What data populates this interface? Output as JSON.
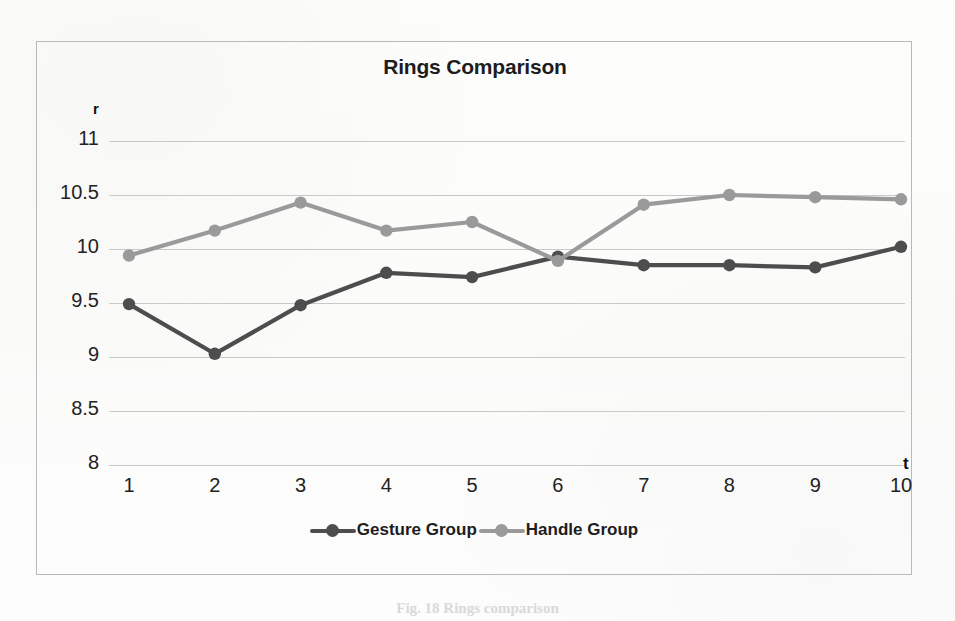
{
  "figure": {
    "caption_fragment": "Fig. 18   Rings comparison"
  },
  "chart_data": {
    "type": "line",
    "title": "Rings Comparison",
    "xlabel": "t",
    "ylabel": "r",
    "x": [
      1,
      2,
      3,
      4,
      5,
      6,
      7,
      8,
      9,
      10
    ],
    "categories": [
      "1",
      "2",
      "3",
      "4",
      "5",
      "6",
      "7",
      "8",
      "9",
      "10"
    ],
    "xlim": [
      0.5,
      10.5
    ],
    "ylim": [
      8,
      11
    ],
    "yticks": [
      "11",
      "10.5",
      "10",
      "9.5",
      "9",
      "8.5",
      "8"
    ],
    "ytick_values": [
      11,
      10.5,
      10,
      9.5,
      9,
      8.5,
      8
    ],
    "grid": "horizontal",
    "legend_position": "bottom",
    "series": [
      {
        "name": "Gesture Group",
        "color": "#4d4d4d",
        "marker": "circle",
        "values": [
          9.49,
          9.03,
          9.48,
          9.78,
          9.74,
          9.93,
          9.85,
          9.85,
          9.83,
          10.02
        ]
      },
      {
        "name": "Handle Group",
        "color": "#9a9a9a",
        "marker": "circle",
        "values": [
          9.94,
          10.17,
          10.43,
          10.17,
          10.25,
          9.89,
          10.41,
          10.5,
          10.48,
          10.46
        ]
      }
    ]
  }
}
